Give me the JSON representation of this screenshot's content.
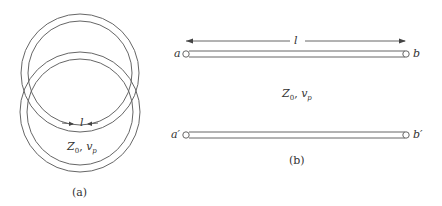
{
  "figure_a": {
    "caption": "(a)",
    "length_label": "l",
    "z_label": "Z",
    "z_sub": "0",
    "sep": ", ",
    "v_label": "v",
    "v_sub": "p"
  },
  "figure_b": {
    "caption": "(b)",
    "length_label": "l",
    "terminal_a": "a",
    "terminal_b": "b",
    "terminal_a_prime": "a′",
    "terminal_b_prime": "b′",
    "z_label": "Z",
    "z_sub": "0",
    "sep": ", ",
    "v_label": "v",
    "v_sub": "p"
  },
  "colors": {
    "stroke": "#555555",
    "text": "#333333",
    "background": "#ffffff"
  }
}
